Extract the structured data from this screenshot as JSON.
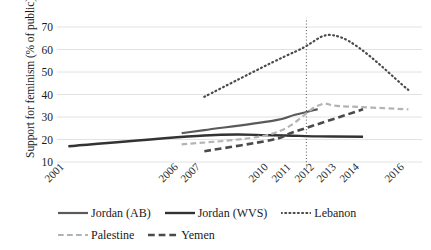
{
  "chart_data": {
    "type": "line",
    "title": "",
    "xlabel": "",
    "ylabel": "Support for feminism (% of public)",
    "x_tick_labels": [
      "2001",
      "2006",
      "2007",
      "2010",
      "2011",
      "2012",
      "2013",
      "2014",
      "2016"
    ],
    "y_tick_labels": [
      "10",
      "20",
      "30",
      "40",
      "50",
      "60",
      "70"
    ],
    "ylim": [
      6,
      74
    ],
    "xlim": [
      2000.5,
      2016.6
    ],
    "grid": "horizontal",
    "legend_position": "bottom",
    "annotations": [
      {
        "name": "arab-spring-marker",
        "type": "vertical-dotted-line",
        "x": 2011.5
      }
    ],
    "series": [
      {
        "name": "Jordan (AB)",
        "style": "solid",
        "color": "#5a5a5a",
        "width": 2.2,
        "x": [
          2006,
          2007,
          2010,
          2011,
          2012
        ],
        "values": [
          22.8,
          24.2,
          28.3,
          31.0,
          33.5
        ]
      },
      {
        "name": "Jordan (WVS)",
        "style": "solid",
        "color": "#333333",
        "width": 2.4,
        "x": [
          2001,
          2007,
          2010,
          2012,
          2014
        ],
        "values": [
          17.0,
          21.8,
          21.9,
          21.4,
          21.2
        ]
      },
      {
        "name": "Lebanon",
        "style": "dotted",
        "color": "#4a4a4a",
        "width": 2.2,
        "x": [
          2007,
          2011,
          2013,
          2016
        ],
        "values": [
          39.0,
          59.0,
          65.5,
          42.0
        ]
      },
      {
        "name": "Palestine",
        "style": "dashed",
        "color": "#b3b3b3",
        "width": 2.2,
        "x": [
          2006,
          2010,
          2012,
          2013,
          2016
        ],
        "values": [
          17.8,
          22.6,
          35.0,
          34.8,
          33.4
        ]
      },
      {
        "name": "Yemen",
        "style": "dashed",
        "color": "#4a4a4a",
        "width": 2.6,
        "x": [
          2007,
          2010,
          2011,
          2014
        ],
        "values": [
          14.8,
          19.9,
          23.5,
          33.4
        ]
      }
    ]
  },
  "legend": {
    "row1": [
      "Jordan (AB)",
      "Jordan (WVS)",
      "Lebanon"
    ],
    "row2": [
      "Palestine",
      "Yemen"
    ]
  },
  "colors": {
    "grid": "#e2e2e2",
    "text": "#1a1a1a",
    "jordan_ab": "#5a5a5a",
    "jordan_wvs": "#333333",
    "lebanon": "#4a4a4a",
    "palestine": "#b3b3b3",
    "yemen": "#4a4a4a"
  }
}
